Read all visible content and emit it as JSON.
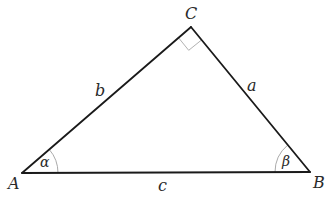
{
  "diagram": {
    "type": "right-triangle",
    "vertices": {
      "A": {
        "label": "A"
      },
      "B": {
        "label": "B"
      },
      "C": {
        "label": "C"
      }
    },
    "sides": {
      "a": {
        "label": "a",
        "between": "B-C"
      },
      "b": {
        "label": "b",
        "between": "A-C"
      },
      "c": {
        "label": "c",
        "between": "A-B"
      }
    },
    "angles": {
      "alpha": {
        "label": "α",
        "at": "A"
      },
      "beta": {
        "label": "β",
        "at": "B"
      },
      "right_angle": {
        "at": "C"
      }
    },
    "colors": {
      "edge": "#1a1a1a",
      "arc": "#9a9a9a",
      "text": "#2a2a2a"
    }
  }
}
